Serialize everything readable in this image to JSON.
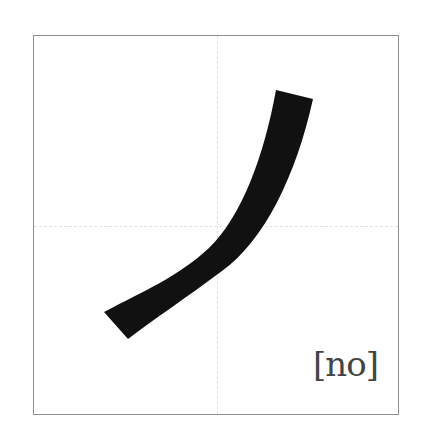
{
  "character": {
    "glyph": "ノ",
    "romaji": "[no]",
    "stroke_color": "#111111",
    "frame_color": "#8f8f8f",
    "guide_color": "#e2e2e2"
  }
}
